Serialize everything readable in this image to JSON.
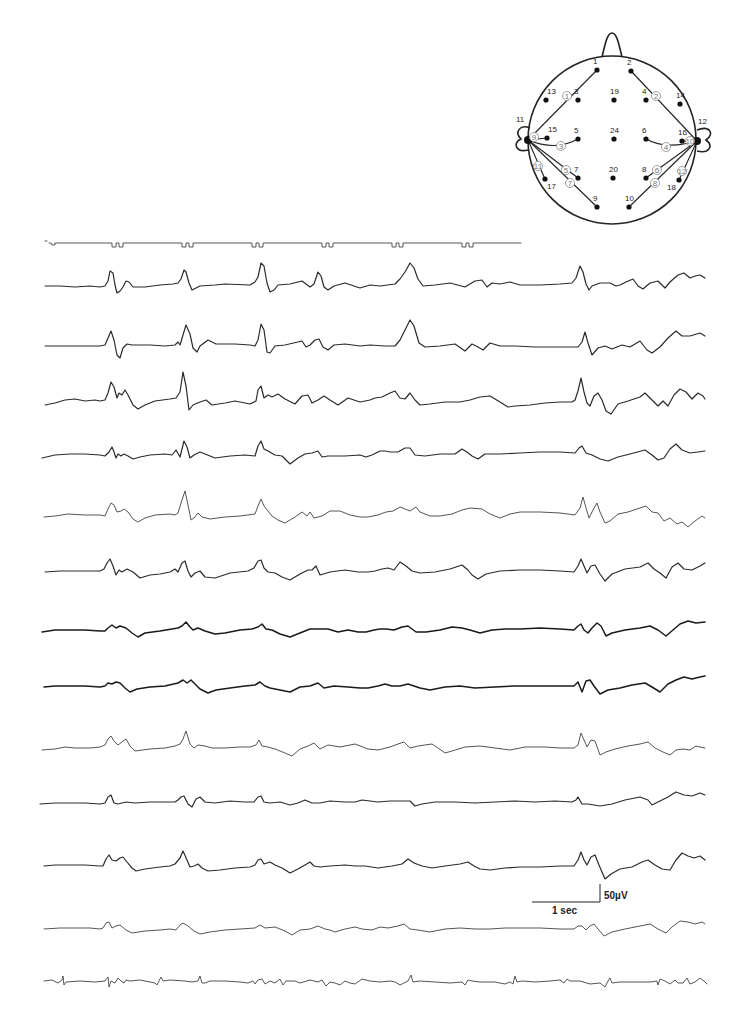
{
  "figure": {
    "type": "EEG recording with electrode montage",
    "channel_count": 13,
    "timing_marker": {
      "label": "time marker",
      "marks_x": [
        117,
        187,
        257,
        327,
        397,
        467
      ]
    },
    "scale_bar": {
      "time_label": "1 sec",
      "amplitude_label": "50µV"
    }
  },
  "montage": {
    "electrodes": [
      {
        "id": "1",
        "x": 597,
        "y": 70
      },
      {
        "id": "2",
        "x": 631,
        "y": 71
      },
      {
        "id": "3",
        "x": 578,
        "y": 100
      },
      {
        "id": "4",
        "x": 646,
        "y": 100
      },
      {
        "id": "5",
        "x": 578,
        "y": 139
      },
      {
        "id": "6",
        "x": 646,
        "y": 139
      },
      {
        "id": "7",
        "x": 578,
        "y": 178
      },
      {
        "id": "8",
        "x": 646,
        "y": 178
      },
      {
        "id": "9",
        "x": 597,
        "y": 207
      },
      {
        "id": "10",
        "x": 629,
        "y": 207
      },
      {
        "id": "11",
        "x": 528,
        "y": 140
      },
      {
        "id": "12",
        "x": 697,
        "y": 141
      },
      {
        "id": "13",
        "x": 546,
        "y": 100
      },
      {
        "id": "14",
        "x": 680,
        "y": 104
      },
      {
        "id": "15",
        "x": 547,
        "y": 138
      },
      {
        "id": "16",
        "x": 682,
        "y": 141
      },
      {
        "id": "17",
        "x": 545,
        "y": 179
      },
      {
        "id": "18",
        "x": 679,
        "y": 180
      },
      {
        "id": "19",
        "x": 614,
        "y": 100
      },
      {
        "id": "20",
        "x": 613,
        "y": 178
      },
      {
        "id": "24",
        "x": 614,
        "y": 139
      }
    ],
    "channels": [
      {
        "id": "1",
        "from": "11",
        "to": "1",
        "label_x": 567,
        "label_y": 96
      },
      {
        "id": "2",
        "from": "12",
        "to": "2",
        "label_x": 656,
        "label_y": 96
      },
      {
        "id": "3",
        "from": "11",
        "to": "5",
        "label_x": 561,
        "label_y": 146
      },
      {
        "id": "4",
        "from": "12",
        "to": "6",
        "label_x": 666,
        "label_y": 147
      },
      {
        "id": "5",
        "from": "11",
        "to": "7",
        "label_x": 566,
        "label_y": 170
      },
      {
        "id": "6",
        "from": "12",
        "to": "8",
        "label_x": 657,
        "label_y": 170
      },
      {
        "id": "7",
        "from": "11",
        "to": "9",
        "label_x": 570,
        "label_y": 183
      },
      {
        "id": "8",
        "from": "12",
        "to": "10",
        "label_x": 655,
        "label_y": 183
      },
      {
        "id": "9",
        "from": "11",
        "to": "15",
        "label_x": 534,
        "label_y": 137
      },
      {
        "id": "10",
        "from": "12",
        "to": "16",
        "label_x": 690,
        "label_y": 141
      },
      {
        "id": "11",
        "from": "11",
        "to": "17",
        "label_x": 538,
        "label_y": 166
      },
      {
        "id": "12",
        "from": "12",
        "to": "18",
        "label_x": 682,
        "label_y": 171
      }
    ]
  },
  "traces": [
    {
      "channel": "1",
      "baseline_y": 286
    },
    {
      "channel": "2",
      "baseline_y": 346
    },
    {
      "channel": "3",
      "baseline_y": 403
    },
    {
      "channel": "4",
      "baseline_y": 455
    },
    {
      "channel": "5",
      "baseline_y": 515
    },
    {
      "channel": "6",
      "baseline_y": 571
    },
    {
      "channel": "7",
      "baseline_y": 632
    },
    {
      "channel": "8",
      "baseline_y": 687
    },
    {
      "channel": "9",
      "baseline_y": 748
    },
    {
      "channel": "10",
      "baseline_y": 802
    },
    {
      "channel": "11",
      "baseline_y": 865
    },
    {
      "channel": "12",
      "baseline_y": 928
    },
    {
      "channel": "13",
      "baseline_y": 983
    }
  ]
}
